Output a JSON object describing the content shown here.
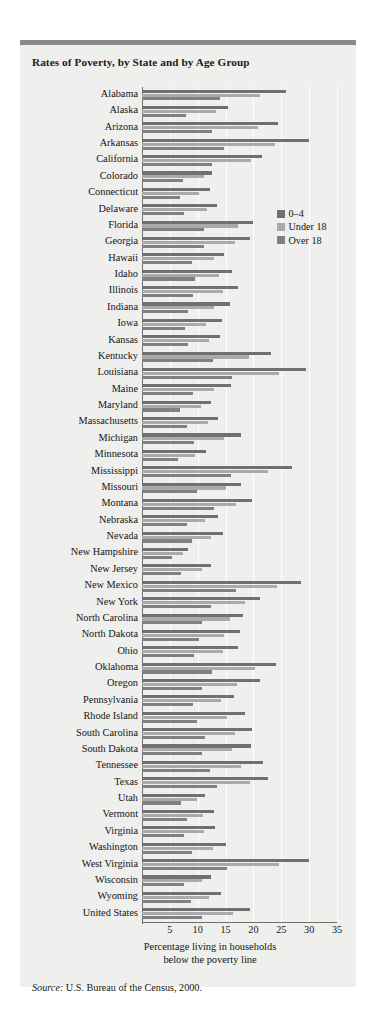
{
  "figure": {
    "title": "Rates of Poverty, by State and by Age Group",
    "source_word": "Source:",
    "source_text": " U.S. Bureau of the Census, 2000.",
    "axis_caption_line1": "Percentage living in households",
    "axis_caption_line2": "below the poverty line"
  },
  "colors": {
    "background": "#efefed",
    "top_rule": "#8a8a8a",
    "series_0_4": "#6f7074",
    "series_under_18": "#a9aaac",
    "series_over_18": "#7f8084",
    "gridline": "#ffffff",
    "axis": "#6f6f6f",
    "text": "#141414"
  },
  "legend": {
    "position": "inside-top-right",
    "items": [
      {
        "label": "0–4",
        "color": "#6f7074"
      },
      {
        "label": "Under 18",
        "color": "#a9aaac"
      },
      {
        "label": "Over 18",
        "color": "#7f8084"
      }
    ]
  },
  "chart_data": {
    "type": "bar",
    "orientation": "horizontal",
    "title": "Rates of Poverty, by State and by Age Group",
    "xlabel": "Percentage living in households below the poverty line",
    "ylabel": "",
    "xlim": [
      0,
      35
    ],
    "xticks": [
      5,
      10,
      15,
      20,
      25,
      30,
      35
    ],
    "grid": true,
    "legend": [
      "0–4",
      "Under 18",
      "Over 18"
    ],
    "categories": [
      "Alabama",
      "Alaska",
      "Arizona",
      "Arkansas",
      "California",
      "Colorado",
      "Connecticut",
      "Delaware",
      "Florida",
      "Georgia",
      "Hawaii",
      "Idaho",
      "Illinois",
      "Indiana",
      "Iowa",
      "Kansas",
      "Kentucky",
      "Louisiana",
      "Maine",
      "Maryland",
      "Massachusetts",
      "Michigan",
      "Minnesota",
      "Mississippi",
      "Missouri",
      "Montana",
      "Nebraska",
      "Nevada",
      "New Hampshire",
      "New Jersey",
      "New Mexico",
      "New York",
      "North Carolina",
      "North Dakota",
      "Ohio",
      "Oklahoma",
      "Oregon",
      "Pennsylvania",
      "Rhode Island",
      "South Carolina",
      "South Dakota",
      "Tennessee",
      "Texas",
      "Utah",
      "Vermont",
      "Virginia",
      "Washington",
      "West Virginia",
      "Wisconsin",
      "Wyoming",
      "United States"
    ],
    "series": [
      {
        "name": "0–4",
        "color": "#6f7074",
        "values": [
          25.8,
          15.4,
          24.4,
          29.9,
          21.5,
          12.5,
          12.2,
          13.4,
          20.0,
          19.3,
          14.8,
          16.2,
          17.3,
          15.8,
          14.3,
          14.0,
          23.1,
          29.4,
          15.9,
          12.4,
          13.6,
          17.8,
          11.4,
          26.9,
          17.8,
          19.8,
          13.6,
          14.6,
          8.3,
          12.3,
          28.6,
          21.2,
          18.2,
          17.5,
          17.2,
          24.1,
          21.1,
          16.6,
          18.4,
          19.8,
          19.5,
          21.7,
          22.6,
          11.3,
          12.9,
          13.1,
          15.1,
          29.9,
          12.4,
          14.2,
          19.3
        ]
      },
      {
        "name": "Under 18",
        "color": "#a9aaac",
        "values": [
          21.2,
          13.2,
          20.8,
          23.9,
          19.6,
          11.2,
          10.3,
          11.6,
          17.3,
          16.7,
          13.0,
          13.8,
          14.6,
          12.9,
          11.5,
          12.0,
          19.2,
          24.6,
          13.0,
          10.6,
          11.8,
          14.7,
          9.6,
          22.7,
          15.0,
          16.8,
          11.3,
          12.4,
          7.4,
          10.7,
          24.2,
          18.4,
          15.8,
          14.7,
          14.5,
          20.2,
          17.1,
          14.1,
          15.3,
          16.7,
          16.2,
          17.8,
          19.4,
          9.8,
          11.0,
          11.2,
          12.8,
          24.6,
          10.8,
          12.0,
          16.4
        ]
      },
      {
        "name": "Over 18",
        "color": "#7f8084",
        "values": [
          14.0,
          7.9,
          12.6,
          14.8,
          12.5,
          7.3,
          6.8,
          7.5,
          11.1,
          11.1,
          8.9,
          9.5,
          9.2,
          8.3,
          7.8,
          8.2,
          12.8,
          16.1,
          9.2,
          6.9,
          8.0,
          9.3,
          6.4,
          15.9,
          9.8,
          13.0,
          8.0,
          9.0,
          5.4,
          7.0,
          16.9,
          12.4,
          10.8,
          10.3,
          9.3,
          12.5,
          10.8,
          9.2,
          9.9,
          11.3,
          10.7,
          12.2,
          13.4,
          7.0,
          8.0,
          7.5,
          9.0,
          15.3,
          7.5,
          8.8,
          10.8
        ]
      }
    ]
  }
}
